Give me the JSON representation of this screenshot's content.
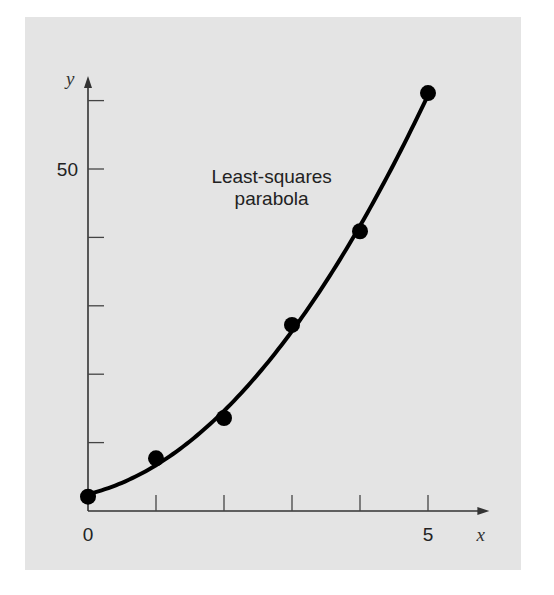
{
  "chart_data": {
    "type": "scatter",
    "title": "",
    "xlabel": "x",
    "ylabel": "y",
    "xlim": [
      0,
      5.8
    ],
    "ylim": [
      0,
      63
    ],
    "x_ticks": [
      0,
      1,
      2,
      3,
      4,
      5
    ],
    "x_tick_labels": {
      "0": "0",
      "5": "5"
    },
    "y_ticks": [
      10,
      20,
      30,
      40,
      50,
      60
    ],
    "y_tick_labels": {
      "50": "50"
    },
    "grid": false,
    "series": [
      {
        "name": "data points",
        "kind": "scatter",
        "x": [
          0,
          1,
          2,
          3,
          4,
          5
        ],
        "y": [
          2.1,
          7.7,
          13.6,
          27.2,
          40.9,
          61.1
        ]
      },
      {
        "name": "Least-squares parabola",
        "kind": "line",
        "equation": "y = 2.47857 + 2.35929x + 1.86071x^2",
        "coefficients": [
          2.47857,
          2.35929,
          1.86071
        ],
        "x_range": [
          0,
          5
        ]
      }
    ],
    "annotations": [
      {
        "text_line1": "Least-squares",
        "text_line2": "parabola",
        "x": 2.7,
        "y": 48
      }
    ]
  }
}
